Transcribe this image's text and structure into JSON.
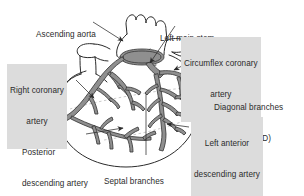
{
  "figure": {
    "kind": "anatomical-diagram",
    "background_color": "#ffffff",
    "ink_color": "#2b2b2b",
    "artery_fill_color": "#8f8f8f",
    "artery_stroke_color": "#3a3a3a",
    "highlight_color": "#dcdcdc",
    "dashed_guide_color": "#b9b9b9"
  },
  "labels": {
    "ascending_aorta": {
      "line1": "Ascending aorta",
      "line2": "",
      "highlighted": false
    },
    "left_main_stem": {
      "line1": "Left main stem",
      "line2": "",
      "highlighted": false
    },
    "circumflex_coronary_artery": {
      "line1": "Circumflex coronary",
      "line2": "artery",
      "highlighted": true
    },
    "right_coronary_artery": {
      "line1": "Right coronary",
      "line2": "artery",
      "highlighted": true
    },
    "diagonal_branches": {
      "line1": "Diagonal branches",
      "line2": "(of the LAD)",
      "highlighted": false
    },
    "left_anterior_descending_artery": {
      "line1": "Left anterior",
      "line2": "descending artery",
      "highlighted": true
    },
    "posterior_descending_artery": {
      "line1": "Posterior",
      "line2": "descending artery",
      "highlighted": false
    },
    "septal_branches": {
      "line1": "Septal branches",
      "line2": "(of the LAD)",
      "highlighted": false
    }
  }
}
